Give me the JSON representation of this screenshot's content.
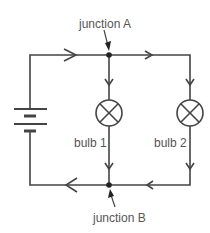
{
  "diagram": {
    "labels": {
      "junction_a": "junction A",
      "junction_b": "junction B",
      "bulb_1": "bulb 1",
      "bulb_2": "bulb 2"
    },
    "components": [
      {
        "type": "battery",
        "name": "cell"
      },
      {
        "type": "bulb",
        "name": "bulb 1"
      },
      {
        "type": "bulb",
        "name": "bulb 2"
      },
      {
        "type": "junction",
        "name": "junction A"
      },
      {
        "type": "junction",
        "name": "junction B"
      }
    ],
    "current_direction": "clockwise from battery top, splitting at junction A, recombining at junction B",
    "colors": {
      "wire": "#444444",
      "text": "#555555",
      "background": "#ffffff"
    }
  }
}
